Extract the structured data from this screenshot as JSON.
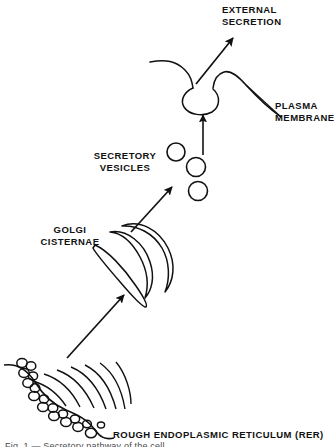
{
  "figure": {
    "background_color": "#ffffff",
    "ink_color": "#111111",
    "width": 334,
    "height": 447
  },
  "labels": {
    "external_secretion": "EXTERNAL\nSECRETION",
    "plasma_membrane": "PLASMA\nMEMBRANE",
    "secretory_vesicles": "SECRETORY\nVESICLES",
    "golgi_cisternae": "GOLGI\nCISTERNAE",
    "rough_er": "ROUGH ENDOPLASMIC RETICULUM (RER)",
    "cut_off_caption": "Fig. 1 — Secretory pathway of the cell"
  },
  "structures": {
    "plasma_membrane": {
      "name": "plasma-membrane-curve",
      "description": "wavy cell-surface membrane line with an invaginated fusion pore"
    },
    "fusion_vesicle": {
      "name": "fusing-vesicle",
      "cx": 203,
      "cy": 98,
      "rx": 16,
      "ry": 13
    },
    "secretory_vesicles": [
      {
        "cx": 176,
        "cy": 152,
        "r": 9
      },
      {
        "cx": 196,
        "cy": 166,
        "r": 9.5
      },
      {
        "cx": 198,
        "cy": 190,
        "r": 9.5
      }
    ],
    "golgi_cisternae": {
      "name": "golgi-stack",
      "cisterna_count": 3,
      "description": "three nested crescent-shaped flattened sacs tilted diagonally"
    },
    "rough_er": {
      "name": "rough-er-membrane",
      "ribosome_count": 18,
      "cisterna_count": 6,
      "description": "curved ER membrane studded with ribosomes plus nested curved cisternae"
    }
  },
  "arrows": [
    {
      "name": "arrow-er-to-golgi",
      "from": "rough endoplasmic reticulum",
      "to": "golgi cisternae"
    },
    {
      "name": "arrow-golgi-to-vesicles",
      "from": "golgi cisternae",
      "to": "secretory vesicles"
    },
    {
      "name": "arrow-vesicle-to-membrane",
      "from": "secretory vesicle",
      "to": "plasma membrane"
    },
    {
      "name": "arrow-external-secretion",
      "from": "fusion pore",
      "to": "external secretion"
    }
  ]
}
